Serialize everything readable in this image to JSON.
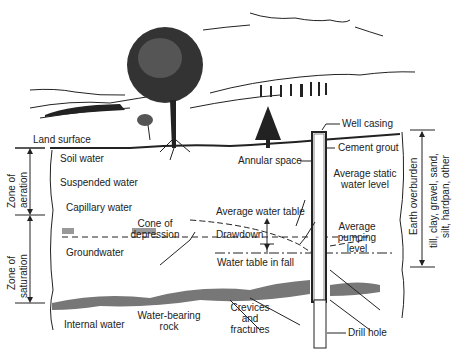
{
  "diagram": {
    "type": "groundwater well cross-section",
    "labels": {
      "land_surface": "Land surface",
      "soil_water": "Soil water",
      "suspended_water": "Suspended water",
      "capillary_water": "Capillary water",
      "groundwater": "Groundwater",
      "internal_water": "Internal water",
      "water_bearing_rock_1": "Water-bearing",
      "water_bearing_rock_2": "rock",
      "crevices_1": "Crevices",
      "crevices_2": "and",
      "crevices_3": "fractures",
      "drill_hole": "Drill hole",
      "well_casing": "Well casing",
      "cement_grout": "Cement grout",
      "annular_space": "Annular space",
      "avg_static_1": "Average static",
      "avg_static_2": "water level",
      "avg_water_table": "Average water table",
      "cone_1": "Cone of",
      "cone_2": "depression",
      "drawdown": "Drawdown",
      "avg_pumping_1": "Average",
      "avg_pumping_2": "pumping",
      "avg_pumping_3": "level",
      "water_table_fall": "Water table in fall",
      "zone_aeration_1": "Zone of",
      "zone_aeration_2": "aeration",
      "zone_saturation_1": "Zone of",
      "zone_saturation_2": "saturation",
      "earth_overburden": "Earth overburden",
      "overburden_types_1": "till, clay, gravel, sand,",
      "overburden_types_2": "silt, hardpan, other"
    },
    "colors": {
      "ink": "#222222",
      "background": "#ffffff"
    }
  }
}
